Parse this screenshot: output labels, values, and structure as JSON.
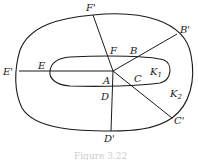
{
  "diagram": {
    "curves": [
      {
        "name": "K1",
        "label": "K",
        "sub": "1",
        "type": "inner-closed-curve"
      },
      {
        "name": "K2",
        "label": "K",
        "sub": "2",
        "type": "outer-closed-curve"
      }
    ],
    "center_point": {
      "label": "A"
    },
    "rays": [
      {
        "inner": "B",
        "outer": "B'"
      },
      {
        "inner": "C",
        "outer": "C'"
      },
      {
        "inner": "D",
        "outer": "D'"
      },
      {
        "inner": "E",
        "outer": "E'"
      },
      {
        "inner": "F",
        "outer": "F'"
      }
    ],
    "caption": "Figure 3.22"
  },
  "colors": {
    "stroke": "#1a1a1a",
    "background": "#ffffff"
  }
}
